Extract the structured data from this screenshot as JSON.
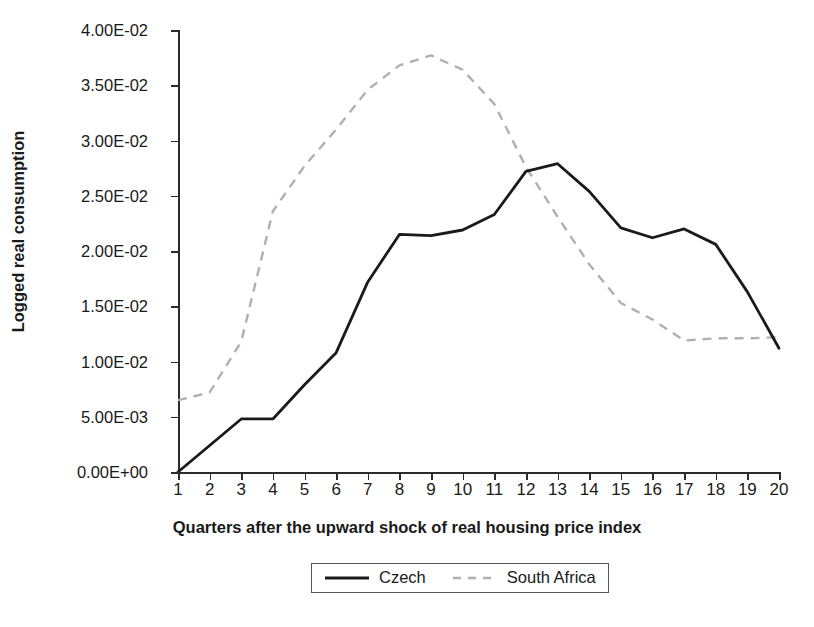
{
  "chart_data": {
    "type": "line",
    "title": "",
    "xlabel": "Quarters after the upward shock of real housing price index",
    "ylabel": "Logged real consumption",
    "x": [
      1,
      2,
      3,
      4,
      5,
      6,
      7,
      8,
      9,
      10,
      11,
      12,
      13,
      14,
      15,
      16,
      17,
      18,
      19,
      20
    ],
    "xlim": [
      1,
      20
    ],
    "ylim": [
      0.0,
      0.04
    ],
    "grid": false,
    "legend_position": "bottom",
    "ytick_values": [
      0.0,
      0.005,
      0.01,
      0.015,
      0.02,
      0.025,
      0.03,
      0.035,
      0.04
    ],
    "ytick_labels": [
      "0.00E+00",
      "5.00E-03",
      "1.00E-02",
      "1.50E-02",
      "2.00E-02",
      "2.50E-02",
      "3.00E-02",
      "3.50E-02",
      "4.00E-02"
    ],
    "xtick_labels": [
      "1",
      "2",
      "3",
      "4",
      "5",
      "6",
      "7",
      "8",
      "9",
      "10",
      "11",
      "12",
      "13",
      "14",
      "15",
      "16",
      "17",
      "18",
      "19",
      "20"
    ],
    "series": [
      {
        "name": "Czech",
        "style": "solid",
        "color": "#1a1a1a",
        "values": [
          0.0,
          0.0024,
          0.0048,
          0.0048,
          0.0079,
          0.0108,
          0.0172,
          0.0215,
          0.0214,
          0.0219,
          0.0233,
          0.0272,
          0.0279,
          0.0254,
          0.0221,
          0.0212,
          0.022,
          0.0206,
          0.0163,
          0.0112
        ]
      },
      {
        "name": "South Africa",
        "style": "dashed",
        "color": "#b0b0b0",
        "values": [
          0.0065,
          0.0072,
          0.0118,
          0.0236,
          0.0277,
          0.031,
          0.0346,
          0.0368,
          0.0377,
          0.0364,
          0.0333,
          0.0276,
          0.0231,
          0.0188,
          0.0153,
          0.0138,
          0.0119,
          0.0121,
          0.0121,
          0.0122
        ]
      }
    ]
  },
  "legend": {
    "entries": [
      {
        "label": "Czech"
      },
      {
        "label": "South Africa"
      }
    ]
  },
  "colors": {
    "axis": "#2b2b2b",
    "czech_line": "#1a1a1a",
    "south_africa_line": "#b0b0b0",
    "background": "#ffffff",
    "text": "#1a1a1a"
  }
}
